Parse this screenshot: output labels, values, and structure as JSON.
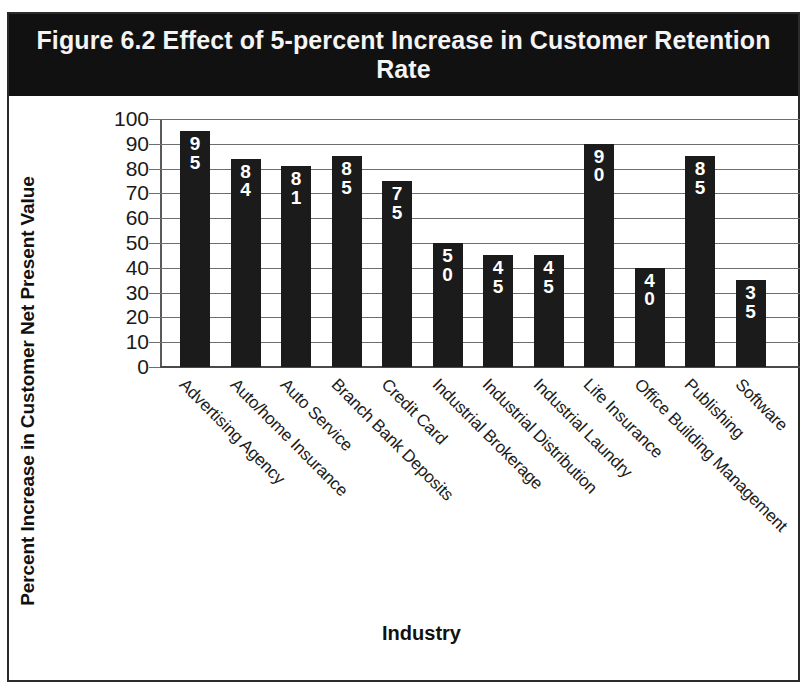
{
  "figure": {
    "title": "Figure 6.2 Effect of 5-percent Increase\nin Customer Retention  Rate",
    "title_background": "#111111",
    "title_color": "#f4f4f4",
    "border_color": "#2b2b2b",
    "bar_color": "#1b1b1b",
    "bar_label_color": "#ffffff",
    "gridline_color": "#6e6e6e"
  },
  "chart_data": {
    "type": "bar",
    "title": "Figure 6.2 Effect of 5-percent Increase in Customer Retention  Rate",
    "xlabel": "Industry",
    "ylabel": "Percent Increase in Customer Net Present Value",
    "ylim": [
      0,
      100
    ],
    "yticks": [
      0,
      10,
      20,
      30,
      40,
      50,
      60,
      70,
      80,
      90,
      100
    ],
    "ytick_labels": [
      "0",
      "10",
      "20",
      "30",
      "40",
      "50",
      "60",
      "70",
      "80",
      "90",
      "100"
    ],
    "grid": true,
    "legend": null,
    "categories": [
      "Advertising Agency",
      "Auto/home Insurance",
      "Auto Service",
      "Branch Bank Deposits",
      "Credit Card",
      "Industrial Brokerage",
      "Industrial Distribution",
      "Industrial Laundry",
      "Life Insurance",
      "Office Building Management",
      "Publishing",
      "Software"
    ],
    "values": [
      95,
      84,
      81,
      85,
      75,
      50,
      45,
      45,
      90,
      40,
      85,
      35
    ],
    "value_labels": [
      "95",
      "84",
      "81",
      "85",
      "75",
      "50",
      "45",
      "45",
      "90",
      "40",
      "85",
      "35"
    ]
  }
}
